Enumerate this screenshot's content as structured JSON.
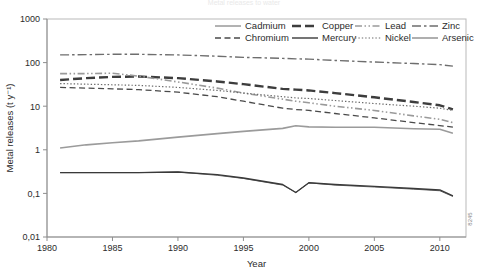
{
  "figure": {
    "ghost_title": "Metal releases to water",
    "source_code": "8245"
  },
  "chart_data": {
    "type": "line",
    "title": "",
    "xlabel": "Year",
    "ylabel": "Metal releases (t y⁻¹)",
    "yscale": "log",
    "ylim": [
      0.01,
      1000
    ],
    "xlim": [
      1980,
      2012
    ],
    "grid": false,
    "legend_position": "top-right-inside",
    "ytick_labels": [
      "1000",
      "100",
      "10",
      "1",
      "0,1",
      "0,01"
    ],
    "ytick_values": [
      1000,
      100,
      10,
      1,
      0.1,
      0.01
    ],
    "xtick_labels": [
      "1980",
      "1985",
      "1990",
      "1995",
      "2000",
      "2005",
      "2010"
    ],
    "xtick_values": [
      1980,
      1985,
      1990,
      1995,
      2000,
      2005,
      2010
    ],
    "x": [
      1981,
      1983,
      1985,
      1987,
      1990,
      1993,
      1995,
      1998,
      1999,
      2000,
      2002,
      2005,
      2008,
      2010,
      2011
    ],
    "series": [
      {
        "name": "Cadmium",
        "style": "solid",
        "color": "#555555",
        "width": 0.9,
        "values": [
          0.3,
          0.3,
          0.3,
          0.3,
          0.31,
          0.26,
          0.22,
          0.155,
          0.105,
          0.175,
          0.155,
          0.14,
          0.125,
          0.115,
          0.085
        ]
      },
      {
        "name": "Chromium",
        "style": "dashed",
        "color": "#4a4a4a",
        "width": 1.3,
        "values": [
          27,
          26,
          25,
          24,
          21,
          16.5,
          13,
          9.0,
          8.4,
          8.0,
          6.8,
          5.4,
          4.2,
          3.6,
          3.3
        ]
      },
      {
        "name": "Copper",
        "style": "long-dash",
        "color": "#3d3d3d",
        "width": 2.4,
        "values": [
          40,
          44,
          47,
          48,
          44,
          37,
          32,
          25,
          24,
          23,
          20,
          16,
          12.5,
          10.5,
          8.5
        ]
      },
      {
        "name": "Mercury",
        "style": "solid",
        "color": "#3a3a3a",
        "width": 1.4,
        "values": [
          0.3,
          0.3,
          0.3,
          0.3,
          0.31,
          0.27,
          0.225,
          0.16,
          0.105,
          0.175,
          0.16,
          0.145,
          0.13,
          0.12,
          0.088
        ]
      },
      {
        "name": "Lead",
        "style": "dash-dot-dot",
        "color": "#9a9a9a",
        "width": 1.6,
        "values": [
          56,
          56,
          57,
          49,
          36,
          26,
          20,
          14.5,
          13,
          12,
          10,
          8.0,
          6.0,
          5.0,
          4.2
        ]
      },
      {
        "name": "Nickel",
        "style": "dotted",
        "color": "#6b6b6b",
        "width": 1.2,
        "values": [
          33,
          32,
          31,
          30,
          27,
          23,
          20,
          16.5,
          15.5,
          15,
          13.5,
          11.5,
          10.0,
          9.0,
          8.0
        ]
      },
      {
        "name": "Zinc",
        "style": "dash-dot",
        "color": "#6e6e6e",
        "width": 1.4,
        "values": [
          150,
          152,
          155,
          155,
          150,
          140,
          132,
          125,
          122,
          120,
          112,
          103,
          95,
          90,
          83
        ]
      },
      {
        "name": "Arsenic",
        "style": "solid",
        "color": "#9b9b9b",
        "width": 1.6,
        "values": [
          1.1,
          1.3,
          1.45,
          1.6,
          1.95,
          2.35,
          2.65,
          3.1,
          3.55,
          3.35,
          3.3,
          3.3,
          3.05,
          2.95,
          2.4
        ]
      }
    ],
    "legend_rows": [
      [
        "Cadmium",
        "Copper",
        "Lead",
        "Zinc"
      ],
      [
        "Chromium",
        "Mercury",
        "Nickel",
        "Arsenic"
      ]
    ]
  }
}
